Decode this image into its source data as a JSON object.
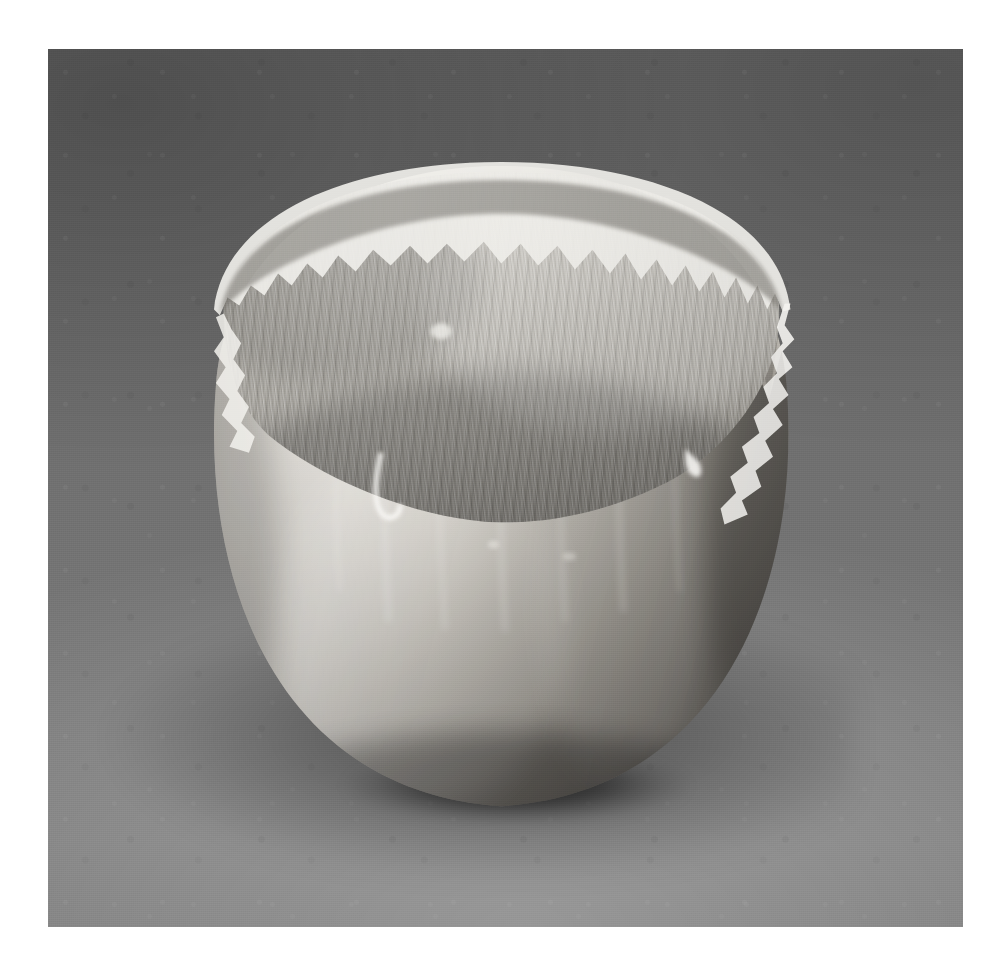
{
  "image": {
    "kind": "photograph",
    "medium": "black-and-white photographic print",
    "orientation": "square",
    "page_background_color": "#ffffff",
    "plate": {
      "left": 48,
      "top": 49,
      "width": 915,
      "height": 878,
      "backdrop_color_top": "#636363",
      "backdrop_color_bottom": "#7e7e7e"
    }
  },
  "subject": {
    "name": "silver bowl",
    "description": "A hand-raised spherical silver vessel with a deeply torn, ragged rim",
    "form": "spherical / ball-shaped body with open top",
    "material": "polished silver metal",
    "rim": "irregular, jagged, torn and folded edge with peaks and valleys",
    "interior": "visible concave bowl wall with fine vertical brushed striations",
    "finish": "high-polish body with satin textured upper zone",
    "lighting": "soft diffuse studio light from upper left",
    "highlight_color": "#f3f2ee",
    "midtone_color": "#b8b6b0",
    "shadow_color": "#4a4a4a",
    "cast_shadow": "soft shadow falling to lower left of the bowl"
  },
  "elements": {
    "backdrop_label": "studio backdrop",
    "shadow_label": "cast shadow",
    "bowl_label": "silver bowl",
    "rim_label": "torn rim",
    "interior_label": "bowl interior",
    "body_label": "bowl body",
    "drip_label": "metal drip"
  }
}
